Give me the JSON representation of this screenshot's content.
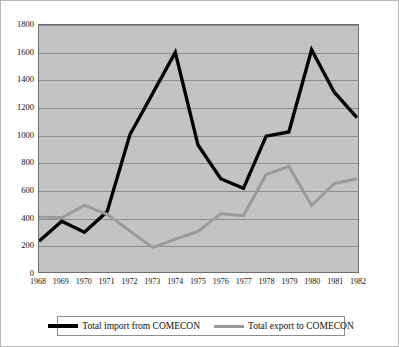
{
  "chart_data": {
    "type": "line",
    "title": "",
    "subtitle": "",
    "xlabel": "",
    "ylabel": "",
    "x": [
      1968,
      1969,
      1970,
      1971,
      1972,
      1973,
      1974,
      1975,
      1976,
      1977,
      1978,
      1979,
      1980,
      1981,
      1982
    ],
    "categories": [
      "1968",
      "1969",
      "1970",
      "1971",
      "1972",
      "1973",
      "1974",
      "1975",
      "1976",
      "1977",
      "1978",
      "1979",
      "1980",
      "1981",
      "1982"
    ],
    "xlim": [
      1968,
      1982
    ],
    "ylim": [
      0,
      1800
    ],
    "ytick_step": 200,
    "yticks": [
      0,
      200,
      400,
      600,
      800,
      1000,
      1200,
      1400,
      1600,
      1800
    ],
    "ytick_labels": [
      "0",
      "200",
      "400",
      "600",
      "800",
      "1000",
      "1200",
      "1400",
      "1600",
      "1800"
    ],
    "grid": "horizontal",
    "legend_position": "bottom",
    "plot_background": "#c3c3c3",
    "series": [
      {
        "name": "Total import from COMECON",
        "color": "#000000",
        "width": 3.4,
        "values": [
          225,
          370,
          290,
          440,
          1000,
          1300,
          1600,
          925,
          680,
          610,
          990,
          1020,
          1620,
          1310,
          1125
        ]
      },
      {
        "name": "Total export to COMECON",
        "color": "#9a9a9a",
        "width": 3.0,
        "values": [
          400,
          395,
          485,
          420,
          300,
          178,
          240,
          295,
          425,
          410,
          710,
          770,
          485,
          645,
          680
        ]
      }
    ],
    "annotations": []
  },
  "legend": {
    "entries": [
      {
        "label": "Total import from COMECON",
        "color": "#000000"
      },
      {
        "label": "Total export to COMECON",
        "color": "#9a9a9a"
      }
    ]
  },
  "colors": {
    "plot_fill": "#c3c3c3",
    "gridline": "#8c8c8c",
    "axis": "#6e6e6e",
    "page_border": "#b9b9b9",
    "import_line": "#000000",
    "export_line": "#9a9a9a"
  }
}
